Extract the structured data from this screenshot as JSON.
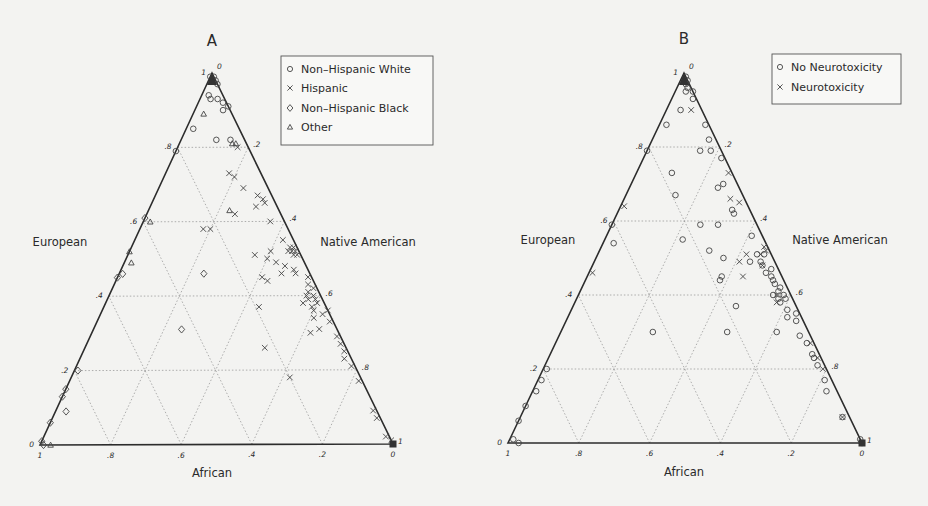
{
  "chart_data": [
    {
      "panel_label": "A",
      "type": "scatter",
      "subtype": "ternary",
      "axes": {
        "top": "European",
        "right": "Native American",
        "bottom": "African"
      },
      "ticks": {
        "left_edge": [
          "0",
          ".2",
          ".4",
          ".6",
          ".8",
          "1"
        ],
        "right_edge": [
          "0",
          ".2",
          ".4",
          ".6",
          ".8",
          "1"
        ],
        "bottom_edge": [
          "1",
          ".8",
          ".6",
          ".4",
          ".2",
          "0"
        ]
      },
      "grid": true,
      "legend_position": "upper right",
      "legend": [
        {
          "label": "Non–Hispanic White",
          "marker": "circle"
        },
        {
          "label": "Hispanic",
          "marker": "x"
        },
        {
          "label": "Non–Hispanic Black",
          "marker": "diamond"
        },
        {
          "label": "Other",
          "marker": "triangle"
        }
      ],
      "series": [
        {
          "name": "Non–Hispanic White",
          "marker": "circle",
          "points_ENA": [
            [
              0.99,
              0.01,
              0.0
            ],
            [
              0.98,
              0.02,
              0.0
            ],
            [
              0.98,
              0.01,
              0.01
            ],
            [
              0.97,
              0.03,
              0.0
            ],
            [
              0.99,
              0.0,
              0.01
            ],
            [
              0.93,
              0.05,
              0.02
            ],
            [
              0.92,
              0.07,
              0.01
            ],
            [
              0.93,
              0.03,
              0.04
            ],
            [
              0.91,
              0.09,
              0.0
            ],
            [
              0.94,
              0.02,
              0.04
            ],
            [
              0.9,
              0.08,
              0.02
            ],
            [
              0.85,
              0.02,
              0.13
            ],
            [
              0.82,
              0.1,
              0.08
            ],
            [
              0.82,
              0.14,
              0.04
            ],
            [
              0.79,
              0.0,
              0.21
            ]
          ]
        },
        {
          "name": "Hispanic",
          "marker": "x",
          "points_ENA": [
            [
              0.8,
              0.17,
              0.03
            ],
            [
              0.73,
              0.18,
              0.09
            ],
            [
              0.69,
              0.24,
              0.07
            ],
            [
              0.72,
              0.2,
              0.08
            ],
            [
              0.67,
              0.29,
              0.04
            ],
            [
              0.66,
              0.31,
              0.03
            ],
            [
              0.65,
              0.32,
              0.03
            ],
            [
              0.64,
              0.3,
              0.06
            ],
            [
              0.62,
              0.25,
              0.13
            ],
            [
              0.6,
              0.36,
              0.04
            ],
            [
              0.58,
              0.2,
              0.22
            ],
            [
              0.58,
              0.18,
              0.24
            ],
            [
              0.55,
              0.42,
              0.03
            ],
            [
              0.53,
              0.45,
              0.02
            ],
            [
              0.53,
              0.46,
              0.01
            ],
            [
              0.52,
              0.46,
              0.02
            ],
            [
              0.52,
              0.47,
              0.01
            ],
            [
              0.51,
              0.47,
              0.02
            ],
            [
              0.51,
              0.48,
              0.01
            ],
            [
              0.52,
              0.45,
              0.03
            ],
            [
              0.52,
              0.4,
              0.08
            ],
            [
              0.51,
              0.36,
              0.13
            ],
            [
              0.5,
              0.4,
              0.1
            ],
            [
              0.49,
              0.43,
              0.08
            ],
            [
              0.48,
              0.46,
              0.06
            ],
            [
              0.47,
              0.49,
              0.04
            ],
            [
              0.46,
              0.5,
              0.04
            ],
            [
              0.46,
              0.46,
              0.08
            ],
            [
              0.45,
              0.54,
              0.01
            ],
            [
              0.45,
              0.41,
              0.14
            ],
            [
              0.44,
              0.43,
              0.13
            ],
            [
              0.43,
              0.55,
              0.02
            ],
            [
              0.42,
              0.57,
              0.01
            ],
            [
              0.41,
              0.56,
              0.03
            ],
            [
              0.4,
              0.58,
              0.02
            ],
            [
              0.4,
              0.56,
              0.04
            ],
            [
              0.39,
              0.59,
              0.02
            ],
            [
              0.39,
              0.57,
              0.04
            ],
            [
              0.38,
              0.6,
              0.02
            ],
            [
              0.38,
              0.56,
              0.06
            ],
            [
              0.37,
              0.59,
              0.04
            ],
            [
              0.37,
              0.44,
              0.19
            ],
            [
              0.36,
              0.6,
              0.04
            ],
            [
              0.35,
              0.63,
              0.02
            ],
            [
              0.34,
              0.61,
              0.05
            ],
            [
              0.33,
              0.66,
              0.01
            ],
            [
              0.31,
              0.64,
              0.05
            ],
            [
              0.3,
              0.62,
              0.08
            ],
            [
              0.29,
              0.7,
              0.01
            ],
            [
              0.26,
              0.51,
              0.23
            ],
            [
              0.27,
              0.72,
              0.01
            ],
            [
              0.25,
              0.74,
              0.01
            ],
            [
              0.23,
              0.75,
              0.02
            ],
            [
              0.21,
              0.78,
              0.01
            ],
            [
              0.18,
              0.62,
              0.2
            ],
            [
              0.17,
              0.82,
              0.01
            ],
            [
              0.09,
              0.9,
              0.01
            ],
            [
              0.07,
              0.92,
              0.01
            ],
            [
              0.01,
              0.99,
              0.0
            ],
            [
              0.0,
              1.0,
              0.0
            ],
            [
              0.02,
              0.97,
              0.01
            ],
            [
              0.36,
              0.64,
              0.0
            ]
          ]
        },
        {
          "name": "Non–Hispanic Black",
          "marker": "diamond",
          "points_ENA": [
            [
              0.61,
              0.0,
              0.39
            ],
            [
              0.46,
              0.01,
              0.53
            ],
            [
              0.45,
              0.0,
              0.55
            ],
            [
              0.46,
              0.24,
              0.3
            ],
            [
              0.31,
              0.25,
              0.44
            ],
            [
              0.2,
              0.01,
              0.79
            ],
            [
              0.15,
              0.0,
              0.85
            ],
            [
              0.13,
              0.0,
              0.87
            ],
            [
              0.09,
              0.03,
              0.88
            ],
            [
              0.06,
              0.0,
              0.94
            ],
            [
              0.01,
              0.0,
              0.99
            ],
            [
              0.0,
              0.01,
              0.99
            ]
          ]
        },
        {
          "name": "Other",
          "marker": "triangle",
          "points_ENA": [
            [
              0.89,
              0.03,
              0.08
            ],
            [
              0.81,
              0.16,
              0.03
            ],
            [
              0.81,
              0.15,
              0.04
            ],
            [
              0.6,
              0.02,
              0.38
            ],
            [
              0.63,
              0.23,
              0.14
            ],
            [
              0.52,
              0.0,
              0.48
            ],
            [
              0.49,
              0.02,
              0.49
            ],
            [
              0.0,
              0.03,
              0.97
            ]
          ]
        }
      ]
    },
    {
      "panel_label": "B",
      "type": "scatter",
      "subtype": "ternary",
      "axes": {
        "top": "European",
        "right": "Native American",
        "bottom": "African"
      },
      "ticks": {
        "left_edge": [
          "0",
          ".2",
          ".4",
          ".6",
          ".8",
          "1"
        ],
        "right_edge": [
          "0",
          ".2",
          ".4",
          ".6",
          ".8",
          "1"
        ],
        "bottom_edge": [
          "1",
          ".8",
          ".6",
          ".4",
          ".2",
          "0"
        ]
      },
      "grid": true,
      "legend_position": "upper right",
      "legend": [
        {
          "label": "No Neurotoxicity",
          "marker": "circle"
        },
        {
          "label": "Neurotoxicity",
          "marker": "x"
        }
      ],
      "series": [
        {
          "name": "No Neurotoxicity",
          "marker": "circle",
          "points_ENA": [
            [
              0.99,
              0.01,
              0.0
            ],
            [
              0.98,
              0.02,
              0.0
            ],
            [
              0.97,
              0.02,
              0.01
            ],
            [
              0.96,
              0.03,
              0.01
            ],
            [
              0.95,
              0.05,
              0.0
            ],
            [
              0.95,
              0.03,
              0.02
            ],
            [
              0.93,
              0.06,
              0.01
            ],
            [
              0.9,
              0.04,
              0.06
            ],
            [
              0.86,
              0.02,
              0.12
            ],
            [
              0.86,
              0.13,
              0.01
            ],
            [
              0.82,
              0.16,
              0.02
            ],
            [
              0.79,
              0.0,
              0.21
            ],
            [
              0.79,
              0.18,
              0.03
            ],
            [
              0.79,
              0.15,
              0.06
            ],
            [
              0.77,
              0.22,
              0.01
            ],
            [
              0.73,
              0.1,
              0.17
            ],
            [
              0.7,
              0.26,
              0.04
            ],
            [
              0.69,
              0.25,
              0.06
            ],
            [
              0.67,
              0.14,
              0.19
            ],
            [
              0.63,
              0.32,
              0.05
            ],
            [
              0.62,
              0.33,
              0.05
            ],
            [
              0.59,
              0.3,
              0.11
            ],
            [
              0.59,
              0.25,
              0.16
            ],
            [
              0.59,
              0.0,
              0.41
            ],
            [
              0.56,
              0.41,
              0.03
            ],
            [
              0.55,
              0.22,
              0.23
            ],
            [
              0.54,
              0.03,
              0.43
            ],
            [
              0.52,
              0.31,
              0.17
            ],
            [
              0.51,
              0.47,
              0.02
            ],
            [
              0.51,
              0.45,
              0.04
            ],
            [
              0.5,
              0.36,
              0.14
            ],
            [
              0.49,
              0.47,
              0.04
            ],
            [
              0.49,
              0.44,
              0.07
            ],
            [
              0.48,
              0.48,
              0.04
            ],
            [
              0.47,
              0.51,
              0.02
            ],
            [
              0.46,
              0.5,
              0.04
            ],
            [
              0.45,
              0.52,
              0.03
            ],
            [
              0.45,
              0.38,
              0.17
            ],
            [
              0.44,
              0.53,
              0.03
            ],
            [
              0.44,
              0.38,
              0.18
            ],
            [
              0.43,
              0.54,
              0.03
            ],
            [
              0.42,
              0.56,
              0.02
            ],
            [
              0.41,
              0.56,
              0.03
            ],
            [
              0.4,
              0.58,
              0.02
            ],
            [
              0.4,
              0.55,
              0.05
            ],
            [
              0.39,
              0.59,
              0.02
            ],
            [
              0.39,
              0.57,
              0.04
            ],
            [
              0.38,
              0.58,
              0.04
            ],
            [
              0.37,
              0.46,
              0.17
            ],
            [
              0.36,
              0.61,
              0.03
            ],
            [
              0.35,
              0.64,
              0.01
            ],
            [
              0.34,
              0.62,
              0.04
            ],
            [
              0.33,
              0.65,
              0.02
            ],
            [
              0.3,
              0.26,
              0.44
            ],
            [
              0.3,
              0.61,
              0.09
            ],
            [
              0.3,
              0.47,
              0.23
            ],
            [
              0.29,
              0.68,
              0.03
            ],
            [
              0.27,
              0.71,
              0.02
            ],
            [
              0.24,
              0.74,
              0.02
            ],
            [
              0.23,
              0.75,
              0.02
            ],
            [
              0.21,
              0.77,
              0.02
            ],
            [
              0.2,
              0.01,
              0.79
            ],
            [
              0.17,
              0.01,
              0.82
            ],
            [
              0.17,
              0.81,
              0.02
            ],
            [
              0.14,
              0.01,
              0.85
            ],
            [
              0.14,
              0.83,
              0.03
            ],
            [
              0.1,
              0.0,
              0.9
            ],
            [
              0.07,
              0.91,
              0.02
            ],
            [
              0.06,
              0.0,
              0.94
            ],
            [
              0.01,
              0.01,
              0.98
            ],
            [
              0.0,
              0.03,
              0.97
            ],
            [
              0.01,
              0.99,
              0.0
            ],
            [
              0.0,
              1.0,
              0.0
            ]
          ]
        },
        {
          "name": "Neurotoxicity",
          "marker": "x",
          "points_ENA": [
            [
              0.9,
              0.07,
              0.03
            ],
            [
              0.73,
              0.26,
              0.01
            ],
            [
              0.66,
              0.3,
              0.04
            ],
            [
              0.65,
              0.33,
              0.02
            ],
            [
              0.64,
              0.01,
              0.35
            ],
            [
              0.53,
              0.46,
              0.01
            ],
            [
              0.52,
              0.47,
              0.01
            ],
            [
              0.51,
              0.46,
              0.03
            ],
            [
              0.51,
              0.42,
              0.07
            ],
            [
              0.49,
              0.41,
              0.1
            ],
            [
              0.48,
              0.48,
              0.04
            ],
            [
              0.46,
              0.01,
              0.53
            ],
            [
              0.45,
              0.44,
              0.11
            ],
            [
              0.4,
              0.56,
              0.04
            ],
            [
              0.38,
              0.57,
              0.05
            ],
            [
              0.27,
              0.72,
              0.01
            ],
            [
              0.23,
              0.76,
              0.01
            ],
            [
              0.2,
              0.79,
              0.01
            ],
            [
              0.07,
              0.91,
              0.02
            ]
          ]
        }
      ]
    }
  ]
}
